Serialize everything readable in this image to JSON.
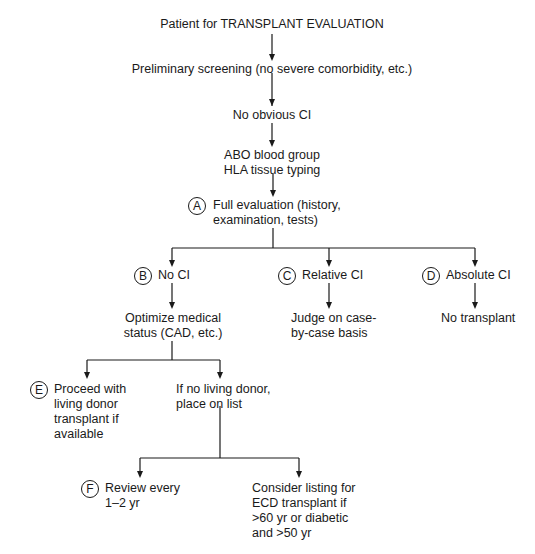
{
  "diagram": {
    "type": "flowchart",
    "nodes": {
      "start": "Patient for TRANSPLANT EVALUATION",
      "screening": "Preliminary screening (no severe comorbidity, etc.)",
      "no_ci": "No obvious CI",
      "typing_1": "ABO blood group",
      "typing_2": "HLA tissue typing",
      "A": {
        "marker": "A",
        "line1": "Full evaluation (history,",
        "line2": "examination, tests)"
      },
      "B": {
        "marker": "B",
        "text": "No CI"
      },
      "C": {
        "marker": "C",
        "text": "Relative CI"
      },
      "D": {
        "marker": "D",
        "text": "Absolute CI"
      },
      "optimize": {
        "line1": "Optimize medical",
        "line2": "status (CAD, etc.)"
      },
      "judge": {
        "line1": "Judge on case-",
        "line2": "by-case basis"
      },
      "no_transplant": "No transplant",
      "E": {
        "marker": "E",
        "line1": "Proceed with",
        "line2": "living donor",
        "line3": "transplant if",
        "line4": "available"
      },
      "list": {
        "line1": "If no living donor,",
        "line2": "place on list"
      },
      "F": {
        "marker": "F",
        "line1": "Review every",
        "line2": "1–2 yr"
      },
      "ecd": {
        "line1": "Consider listing for",
        "line2": "ECD transplant if",
        "line3": ">60 yr or diabetic",
        "line4": "and >50 yr"
      }
    }
  }
}
